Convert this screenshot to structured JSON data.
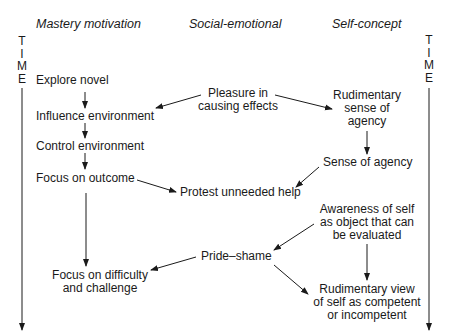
{
  "columns": {
    "mastery": "Mastery motivation",
    "social": "Social-emotional",
    "self": "Self-concept"
  },
  "time_axis": {
    "letters": [
      "T",
      "I",
      "M",
      "E"
    ]
  },
  "nodes": {
    "explore_novel": "Explore novel",
    "influence_environment": "Influence environment",
    "control_environment": "Control environment",
    "focus_on_outcome": "Focus on outcome",
    "focus_difficulty_1": "Focus on difficulty",
    "focus_difficulty_2": "and challenge",
    "pleasure_1": "Pleasure in",
    "pleasure_2": "causing effects",
    "protest_help": "Protest unneeded help",
    "pride_shame": "Pride–shame",
    "rudimentary_agency_1": "Rudimentary",
    "rudimentary_agency_2": "sense of",
    "rudimentary_agency_3": "agency",
    "sense_of_agency": "Sense of agency",
    "awareness_1": "Awareness of self",
    "awareness_2": "as object that can",
    "awareness_3": "be evaluated",
    "rudimentary_view_1": "Rudimentary view",
    "rudimentary_view_2": "of self as competent",
    "rudimentary_view_3": "or incompetent"
  },
  "edges": [
    {
      "from": "Explore novel",
      "to": "Influence environment"
    },
    {
      "from": "Influence environment",
      "to": "Control environment"
    },
    {
      "from": "Control environment",
      "to": "Focus on outcome"
    },
    {
      "from": "Focus on outcome",
      "to": "Focus on difficulty and challenge"
    },
    {
      "from": "Pleasure in causing effects",
      "to": "Influence environment"
    },
    {
      "from": "Pleasure in causing effects",
      "to": "Rudimentary sense of agency"
    },
    {
      "from": "Rudimentary sense of agency",
      "to": "Sense of agency"
    },
    {
      "from": "Focus on outcome",
      "to": "Protest unneeded help"
    },
    {
      "from": "Sense of agency",
      "to": "Protest unneeded help"
    },
    {
      "from": "Awareness of self as object that can be evaluated",
      "to": "Pride–shame"
    },
    {
      "from": "Awareness of self as object that can be evaluated",
      "to": "Rudimentary view of self as competent or incompetent"
    },
    {
      "from": "Pride–shame",
      "to": "Focus on difficulty and challenge"
    },
    {
      "from": "Pride–shame",
      "to": "Rudimentary view of self as competent or incompetent"
    }
  ]
}
